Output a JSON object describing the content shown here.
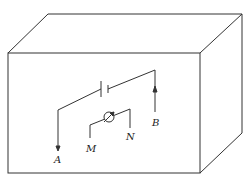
{
  "diagram": {
    "type": "circuit-in-box",
    "labels": {
      "A": "A",
      "B": "B",
      "M": "M",
      "N": "N"
    },
    "components": [
      {
        "name": "battery",
        "icon": "battery-icon"
      },
      {
        "name": "galvanometer",
        "icon": "meter-icon"
      }
    ],
    "colors": {
      "line": "#333333",
      "background": "#ffffff"
    }
  }
}
